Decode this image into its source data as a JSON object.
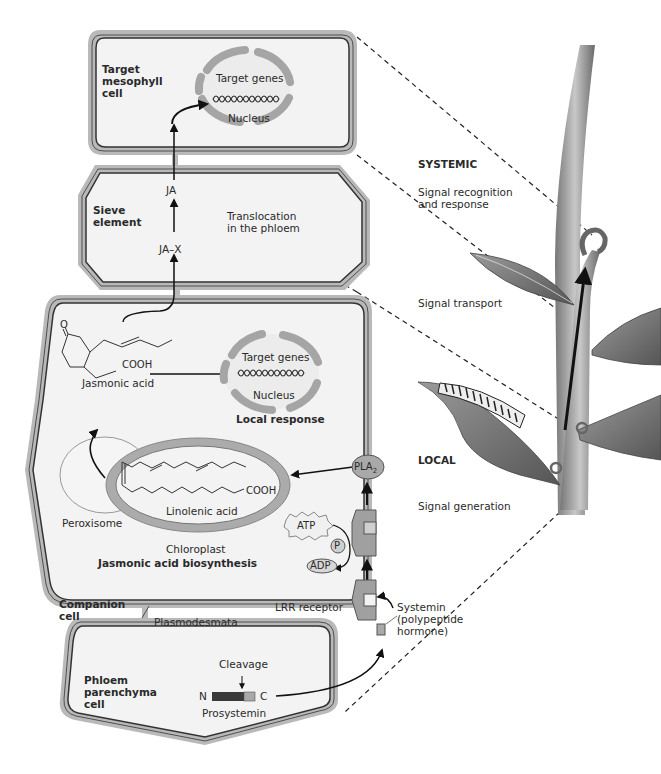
{
  "figure": {
    "cells": {
      "target_mesophyll": {
        "label_line1": "Target",
        "label_line2": "mesophyll",
        "label_line3": "cell"
      },
      "sieve_element": {
        "label_line1": "Sieve",
        "label_line2": "element"
      },
      "companion_cell": {
        "label_line1": "Companion",
        "label_line2": "cell"
      },
      "phloem_parenchyma": {
        "label_line1": "Phloem",
        "label_line2": "parenchyma",
        "label_line3": "cell"
      }
    },
    "top_nucleus": {
      "genes_label": "Target genes",
      "nucleus_label": "Nucleus"
    },
    "sieve": {
      "ja_label": "JA",
      "jax_label": "JA–X",
      "translocation_line1": "Translocation",
      "translocation_line2": "in the phloem"
    },
    "companion": {
      "jasmonic_acid_label": "Jasmonic acid",
      "cooh_label": "COOH",
      "ketone_label": "O",
      "local_nucleus": {
        "genes_label": "Target genes",
        "nucleus_label": "Nucleus"
      },
      "local_response_label": "Local response",
      "peroxisome_label": "Peroxisome",
      "linolenic_acid_label": "Linolenic acid",
      "linolenic_cooh_label": "COOH",
      "chloroplast_label": "Chloroplast",
      "biosynthesis_label": "Jasmonic acid biosynthesis",
      "pla2_label": "PLA",
      "pla2_sub": "2",
      "atp_label": "ATP",
      "p_label": "P",
      "adp_label": "ADP",
      "lrr_label": "LRR receptor"
    },
    "plasmodesmata_label": "Plasmodesmata",
    "parenchyma": {
      "cleavage_label": "Cleavage",
      "n_label": "N",
      "c_label": "C",
      "prosystemin_label": "Prosystemin"
    },
    "systemin": {
      "line1": "Systemin",
      "line2": "(polypeptide",
      "line3": "hormone)"
    },
    "right_panel": {
      "systemic_label": "SYSTEMIC",
      "signal_recognition_line1": "Signal recognition",
      "signal_recognition_line2": "and response",
      "signal_transport_label": "Signal transport",
      "local_label": "LOCAL",
      "signal_generation_label": "Signal generation"
    },
    "colors": {
      "wall_gray": "#b9b9b9",
      "cytoplasm": "#f3f3f3",
      "membrane": "#333333",
      "organelle_gray": "#a9a9a9",
      "leaf_dark": "#6e6e6e",
      "receptor_gray": "#9a9a9a"
    }
  }
}
